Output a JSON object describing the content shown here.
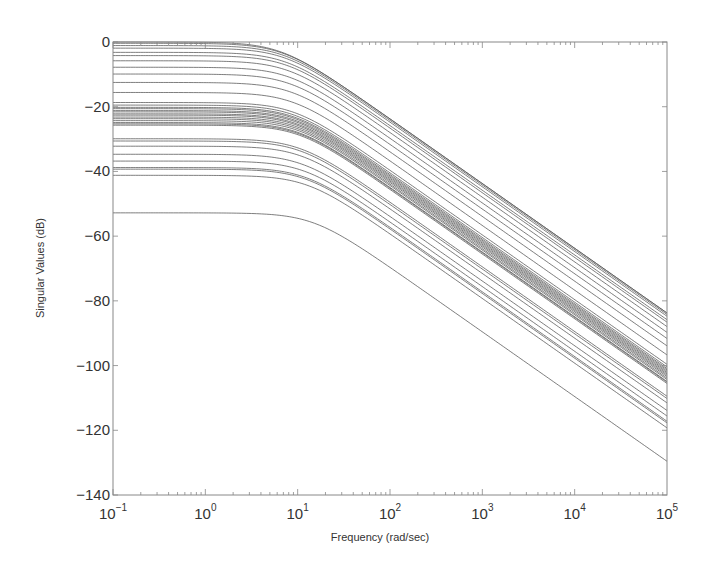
{
  "chart_data": {
    "type": "line",
    "title": "",
    "xlabel": "Frequency (rad/sec)",
    "ylabel": "Singular Values (dB)",
    "xscale": "log",
    "xlim": [
      0.1,
      100000
    ],
    "ylim": [
      -140,
      0
    ],
    "grid": false,
    "legend": null,
    "x_ticks": [
      {
        "value": 0.1,
        "base": "10",
        "exp": "−1"
      },
      {
        "value": 1,
        "base": "10",
        "exp": "0"
      },
      {
        "value": 10,
        "base": "10",
        "exp": "1"
      },
      {
        "value": 100,
        "base": "10",
        "exp": "2"
      },
      {
        "value": 1000,
        "base": "10",
        "exp": "3"
      },
      {
        "value": 10000,
        "base": "10",
        "exp": "4"
      },
      {
        "value": 100000,
        "base": "10",
        "exp": "5"
      }
    ],
    "y_ticks": [
      0,
      -20,
      -40,
      -60,
      -80,
      -100,
      -120,
      -140
    ],
    "y_tick_labels": [
      "0",
      "−20",
      "−40",
      "−60",
      "−80",
      "−100",
      "−120",
      "−140"
    ],
    "model": "first-order low-pass: dB(w) = dc_db - 10*log10(1+(w/wc)^2)",
    "series": [
      {
        "name": "sv1",
        "dc_db": 0.0,
        "wc": 6.5
      },
      {
        "name": "sv2",
        "dc_db": -0.4,
        "wc": 6.8
      },
      {
        "name": "sv3",
        "dc_db": -1.1,
        "wc": 7.0
      },
      {
        "name": "sv4",
        "dc_db": -1.9,
        "wc": 7.2
      },
      {
        "name": "sv5",
        "dc_db": -3.2,
        "wc": 7.4
      },
      {
        "name": "sv6",
        "dc_db": -4.2,
        "wc": 7.6
      },
      {
        "name": "sv7",
        "dc_db": -5.8,
        "wc": 7.8
      },
      {
        "name": "sv8",
        "dc_db": -7.8,
        "wc": 8.0
      },
      {
        "name": "sv9",
        "dc_db": -9.9,
        "wc": 8.2
      },
      {
        "name": "sv10",
        "dc_db": -12.5,
        "wc": 8.5
      },
      {
        "name": "sv11",
        "dc_db": -15.6,
        "wc": 8.8
      },
      {
        "name": "sv12",
        "dc_db": -18.7,
        "wc": 9.0
      },
      {
        "name": "sv13",
        "dc_db": -19.5,
        "wc": 9.0
      },
      {
        "name": "sv14",
        "dc_db": -20.2,
        "wc": 9.2
      },
      {
        "name": "sv15",
        "dc_db": -20.6,
        "wc": 9.2
      },
      {
        "name": "sv16",
        "dc_db": -21.2,
        "wc": 9.4
      },
      {
        "name": "sv17",
        "dc_db": -21.6,
        "wc": 9.4
      },
      {
        "name": "sv18",
        "dc_db": -22.2,
        "wc": 9.6
      },
      {
        "name": "sv19",
        "dc_db": -22.6,
        "wc": 9.6
      },
      {
        "name": "sv20",
        "dc_db": -23.2,
        "wc": 9.8
      },
      {
        "name": "sv21",
        "dc_db": -23.7,
        "wc": 9.8
      },
      {
        "name": "sv22",
        "dc_db": -24.3,
        "wc": 10.0
      },
      {
        "name": "sv23",
        "dc_db": -24.9,
        "wc": 10.0
      },
      {
        "name": "sv24",
        "dc_db": -25.3,
        "wc": 10.2
      },
      {
        "name": "sv25",
        "dc_db": -25.7,
        "wc": 10.2
      },
      {
        "name": "sv26",
        "dc_db": -29.9,
        "wc": 10.5
      },
      {
        "name": "sv27",
        "dc_db": -30.6,
        "wc": 10.5
      },
      {
        "name": "sv28",
        "dc_db": -32.2,
        "wc": 10.8
      },
      {
        "name": "sv29",
        "dc_db": -34.7,
        "wc": 11.0
      },
      {
        "name": "sv30",
        "dc_db": -36.8,
        "wc": 11.5
      },
      {
        "name": "sv31",
        "dc_db": -38.8,
        "wc": 12.0
      },
      {
        "name": "sv32",
        "dc_db": -39.3,
        "wc": 12.0
      },
      {
        "name": "sv33",
        "dc_db": -41.2,
        "wc": 12.5
      },
      {
        "name": "sv34",
        "dc_db": -52.8,
        "wc": 14.5
      }
    ]
  },
  "colors": {
    "line": "#555555",
    "axis": "#888888",
    "text": "#333333",
    "background": "#ffffff"
  },
  "layout": {
    "plot_left": 113,
    "plot_right": 667,
    "plot_top": 42,
    "plot_bottom": 495
  }
}
